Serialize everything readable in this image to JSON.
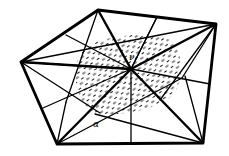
{
  "diagram": {
    "type": "geometric-triangulation",
    "colors": {
      "stroke": "#000000",
      "background": "#ffffff",
      "hatch": "#000000"
    },
    "vertices": {
      "top": [
        98,
        10
      ],
      "top_right": [
        216,
        24
      ],
      "left": [
        21,
        62
      ],
      "bottom_left": [
        57,
        144
      ],
      "bottom_right": [
        203,
        143
      ],
      "center": [
        131,
        69
      ]
    },
    "shaded_region": {
      "cx": 126,
      "cy": 76,
      "rx": 54,
      "ry": 40,
      "rotate": -18
    },
    "labels": [
      {
        "id": "center-label",
        "text": "ν",
        "x": 131,
        "y": 58
      },
      {
        "id": "angle-label",
        "text": "α",
        "x": 95,
        "y": 126
      }
    ]
  }
}
